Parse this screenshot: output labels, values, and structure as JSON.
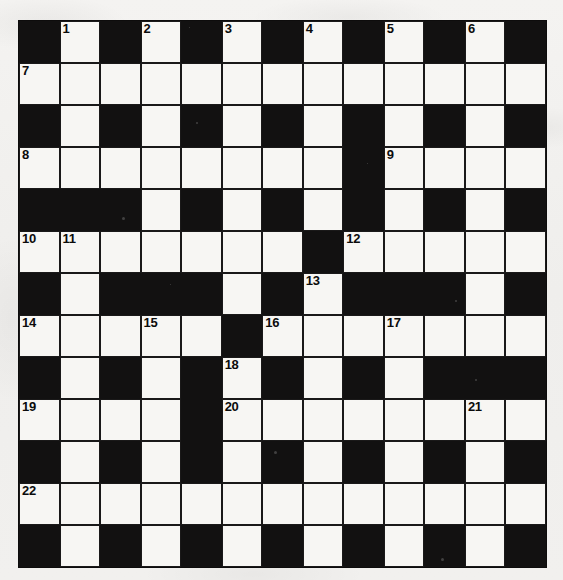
{
  "puzzle": {
    "title": "Crossword Grid",
    "type": "crossword",
    "rows": 13,
    "cols": 13,
    "colors": {
      "block": "#121111",
      "light": "#f7f6f3",
      "paper": "#f2f1ef",
      "number": "#0b0b0b"
    },
    "legend": {
      "block": "#",
      "light": "."
    },
    "grid": [
      "#.#.#.#.#.#.#",
      ".............",
      "#.#.#.#.#.#.#",
      "........#....",
      "###.#.#.#.#.#",
      ".......#.....",
      "#.###.#.###.#",
      ".....#.......",
      "#.#.#.#.#.###",
      "....#........",
      "#.#.#.#.#.#.#",
      ".............",
      "#.#.#.#.#.#.#"
    ],
    "numbers": [
      {
        "row": 0,
        "col": 1,
        "n": "1"
      },
      {
        "row": 0,
        "col": 3,
        "n": "2"
      },
      {
        "row": 0,
        "col": 5,
        "n": "3"
      },
      {
        "row": 0,
        "col": 7,
        "n": "4"
      },
      {
        "row": 0,
        "col": 9,
        "n": "5"
      },
      {
        "row": 0,
        "col": 11,
        "n": "6"
      },
      {
        "row": 1,
        "col": 0,
        "n": "7"
      },
      {
        "row": 3,
        "col": 0,
        "n": "8"
      },
      {
        "row": 3,
        "col": 9,
        "n": "9"
      },
      {
        "row": 5,
        "col": 0,
        "n": "10"
      },
      {
        "row": 5,
        "col": 1,
        "n": "11"
      },
      {
        "row": 5,
        "col": 8,
        "n": "12"
      },
      {
        "row": 6,
        "col": 7,
        "n": "13"
      },
      {
        "row": 7,
        "col": 0,
        "n": "14"
      },
      {
        "row": 7,
        "col": 3,
        "n": "15"
      },
      {
        "row": 7,
        "col": 6,
        "n": "16"
      },
      {
        "row": 7,
        "col": 9,
        "n": "17"
      },
      {
        "row": 8,
        "col": 5,
        "n": "18"
      },
      {
        "row": 9,
        "col": 0,
        "n": "19"
      },
      {
        "row": 9,
        "col": 5,
        "n": "20"
      },
      {
        "row": 9,
        "col": 11,
        "n": "21"
      },
      {
        "row": 11,
        "col": 0,
        "n": "22"
      }
    ]
  }
}
